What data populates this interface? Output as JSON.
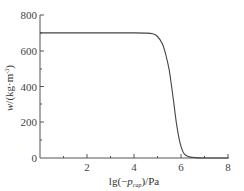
{
  "chart_data": {
    "type": "line",
    "title": "",
    "xlabel": "lg(−p_cap)/Pa",
    "xlabel_parts": {
      "pre": "lg(−",
      "var": "p",
      "sub": "cap",
      "post": ")/Pa"
    },
    "ylabel": "w/(kg·m⁻³)",
    "ylabel_parts": {
      "var": "w",
      "post": "/(kg·m",
      "sup": "-3",
      "close": ")"
    },
    "xlim": [
      0,
      8
    ],
    "ylim": [
      0,
      800
    ],
    "xticks": [
      2,
      4,
      6,
      8
    ],
    "xtick_labels": [
      "2",
      "4",
      "6",
      "8"
    ],
    "yticks": [
      0,
      200,
      400,
      600,
      800
    ],
    "ytick_labels": [
      "0",
      "200",
      "400",
      "600",
      "800"
    ],
    "grid": false,
    "legend": null,
    "series": [
      {
        "name": "w",
        "x": [
          0,
          1,
          2,
          3,
          4,
          4.5,
          4.8,
          5.0,
          5.2,
          5.35,
          5.5,
          5.6,
          5.7,
          5.8,
          5.9,
          6.0,
          6.1,
          6.2,
          6.4,
          6.6,
          7.0,
          7.5,
          8.0
        ],
        "values": [
          700,
          700,
          700,
          700,
          700,
          699,
          695,
          680,
          640,
          580,
          490,
          400,
          300,
          200,
          120,
          65,
          30,
          15,
          5,
          2,
          0,
          0,
          0
        ]
      }
    ]
  }
}
